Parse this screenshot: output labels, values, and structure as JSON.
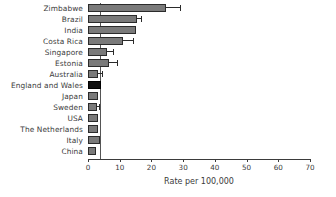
{
  "chart_data": {
    "type": "bar",
    "orientation": "horizontal",
    "title": "",
    "xlabel": "Rate per 100,000",
    "ylabel": "",
    "xlim": [
      0,
      70
    ],
    "xticks": [
      0,
      10,
      20,
      30,
      40,
      50,
      60,
      70
    ],
    "grid": false,
    "legend": false,
    "reference_line": 3.8,
    "categories": [
      "Zimbabwe",
      "Brazil",
      "India",
      "Costa Rica",
      "Singapore",
      "Estonia",
      "Australia",
      "England and Wales",
      "Japan",
      "Sweden",
      "USA",
      "The Netherlands",
      "Italy",
      "China"
    ],
    "values": [
      24.5,
      15.5,
      15.0,
      11.0,
      6.0,
      6.6,
      3.2,
      4.0,
      3.2,
      2.8,
      3.3,
      3.0,
      3.8,
      2.6
    ],
    "error_high": [
      29.0,
      16.6,
      15.0,
      14.2,
      8.0,
      9.0,
      4.3,
      4.0,
      3.2,
      3.6,
      3.3,
      3.0,
      3.8,
      2.6
    ],
    "highlight_category": "England and Wales",
    "colors": {
      "bar": "#7a7a7a",
      "bar_edge": "#2b2b2b",
      "highlight_bar": "#101010",
      "error_bar": "#2b2b2b",
      "reference_line": "#555555",
      "axis": "#3b3b3b",
      "text": "#3b3b3b",
      "background": "#ffffff"
    }
  }
}
